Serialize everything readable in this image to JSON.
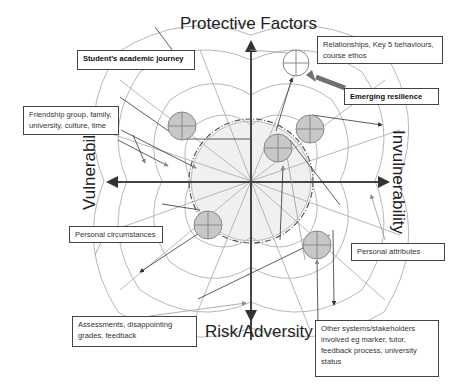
{
  "axes": {
    "top": "Protective Factors",
    "bottom": "Risk/Adversity",
    "left": "Vulnerability",
    "right": "Invulnerability"
  },
  "boxes": {
    "academic_journey": "Student’s academic journey",
    "relationships": "Relationships, Key 5 behaviours, course ethos",
    "emerging_resilience": "Emerging resilience",
    "friendship": "Friendship group, family, university, culture, time",
    "personal_circumstances": "Personal circumstances",
    "personal_attributes": "Personal attributes",
    "assessments": "Assessments, disappointing grades, feedback",
    "other_systems": "Other systems/stakeholders involved eg marker, tutor, feedback process, university status"
  },
  "colors": {
    "web": "#b8b8b8",
    "axis": "#444444",
    "node_fill": "#c8c8c8",
    "inner_fill": "#f0f0f0",
    "thick_arrow": "#707070"
  }
}
